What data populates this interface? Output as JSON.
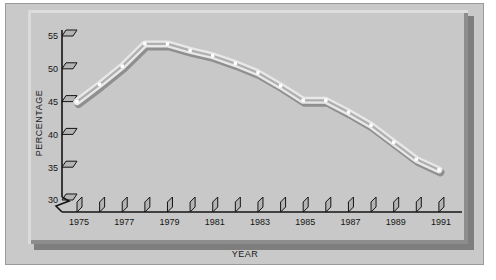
{
  "chart_data": {
    "type": "line",
    "title": "",
    "xlabel": "YEAR",
    "ylabel": "PERCENTAGE",
    "x": [
      1975,
      1976,
      1977,
      1978,
      1979,
      1980,
      1981,
      1982,
      1983,
      1984,
      1985,
      1986,
      1987,
      1988,
      1989,
      1990,
      1991
    ],
    "values": [
      45.0,
      47.6,
      50.4,
      53.8,
      53.8,
      52.8,
      52.0,
      50.8,
      49.4,
      47.4,
      45.2,
      45.2,
      43.4,
      41.4,
      38.8,
      36.2,
      34.6
    ],
    "series": [
      {
        "name": "percentage",
        "values": [
          45.0,
          47.6,
          50.4,
          53.8,
          53.8,
          52.8,
          52.0,
          50.8,
          49.4,
          47.4,
          45.2,
          45.2,
          43.4,
          41.4,
          38.8,
          36.2,
          34.6
        ]
      }
    ],
    "xlim": [
      1974.3,
      1991.6
    ],
    "ylim": [
      30,
      55.8
    ],
    "ytick_labels": [
      "55",
      "50",
      "45",
      "40",
      "35",
      "30"
    ],
    "ytick_values": [
      55,
      50,
      45,
      40,
      35,
      30
    ],
    "xtick_values": [
      1975,
      1976,
      1977,
      1978,
      1979,
      1980,
      1981,
      1982,
      1983,
      1984,
      1985,
      1986,
      1987,
      1988,
      1989,
      1990,
      1991
    ],
    "xtick_labels_shown": [
      "1975",
      "1977",
      "1979",
      "1981",
      "1983",
      "1985",
      "1987",
      "1989",
      "1991"
    ],
    "grid": false,
    "legend": "none",
    "axis_break": "y-axis zigzag break below 30",
    "marker": "square-white",
    "colors": {
      "plot_background": "#c8c8c8",
      "figure_background": "#c9c9c9",
      "line_light": "#e8e8e8",
      "line_shadow": "#8f8f8f",
      "axis": "#141414",
      "text": "#141414",
      "slab_shadow": "#7e7e7e"
    }
  },
  "axes": {
    "x_title": "YEAR",
    "y_title": "PERCENTAGE"
  },
  "y_ticks": [
    {
      "label": "55",
      "value": 55
    },
    {
      "label": "50",
      "value": 50
    },
    {
      "label": "45",
      "value": 45
    },
    {
      "label": "40",
      "value": 40
    },
    {
      "label": "35",
      "value": 35
    },
    {
      "label": "30",
      "value": 30
    }
  ],
  "x_ticks": [
    {
      "label": "1975",
      "value": 1975
    },
    {
      "label": "",
      "value": 1976
    },
    {
      "label": "1977",
      "value": 1977
    },
    {
      "label": "",
      "value": 1978
    },
    {
      "label": "1979",
      "value": 1979
    },
    {
      "label": "",
      "value": 1980
    },
    {
      "label": "1981",
      "value": 1981
    },
    {
      "label": "",
      "value": 1982
    },
    {
      "label": "1983",
      "value": 1983
    },
    {
      "label": "",
      "value": 1984
    },
    {
      "label": "1985",
      "value": 1985
    },
    {
      "label": "",
      "value": 1986
    },
    {
      "label": "1987",
      "value": 1987
    },
    {
      "label": "",
      "value": 1988
    },
    {
      "label": "1989",
      "value": 1989
    },
    {
      "label": "",
      "value": 1990
    },
    {
      "label": "1991",
      "value": 1991
    }
  ]
}
